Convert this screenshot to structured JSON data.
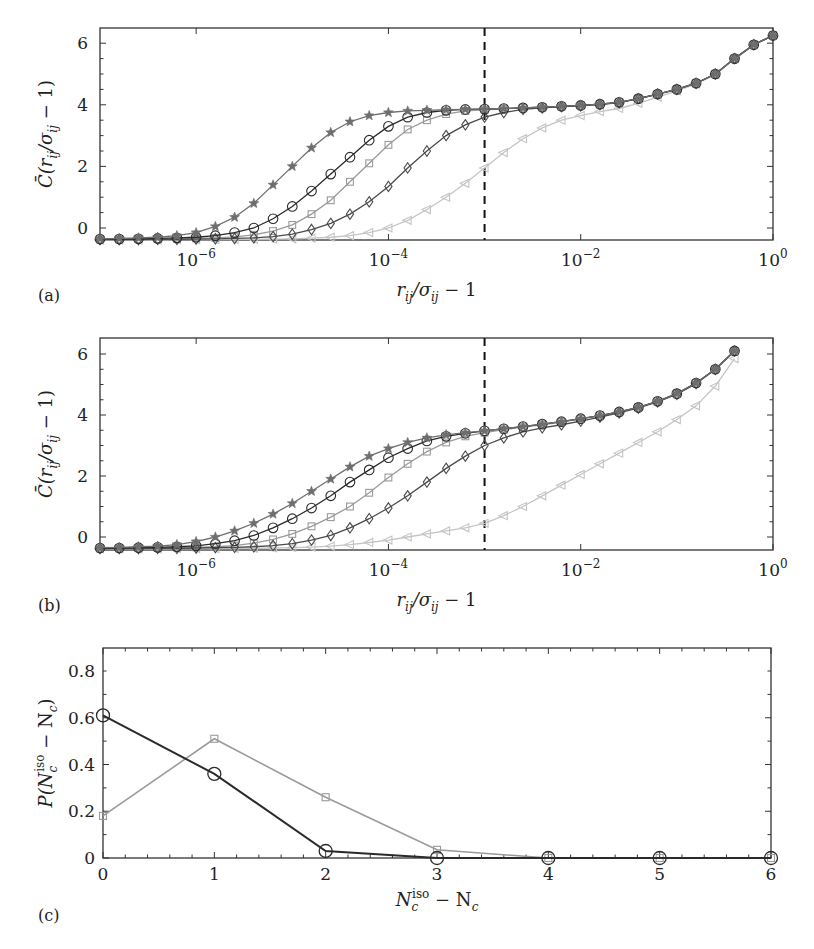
{
  "figure": {
    "panels": [
      {
        "id": "a",
        "label": "(a)",
        "xlabel": "r_ij/σ_ij − 1",
        "ylabel": "C̄(r_ij/σ_ij − 1)"
      },
      {
        "id": "b",
        "label": "(b)",
        "xlabel": "r_ij/σ_ij − 1",
        "ylabel": "C̄(r_ij/σ_ij − 1)"
      },
      {
        "id": "c",
        "label": "(c)",
        "xlabel": "N_c^iso − N_c",
        "ylabel": "P(N_c^iso − N_c)"
      }
    ]
  },
  "chart_data": [
    {
      "panel": "a",
      "type": "line",
      "title": "",
      "xlabel": "r_ij/σ_ij − 1",
      "ylabel": "C̄(r_ij/σ_ij − 1)",
      "xscale": "log",
      "xlim": [
        1e-07,
        1
      ],
      "ylim": [
        -0.4,
        6.4
      ],
      "xticks": [
        "10^-6",
        "10^-4",
        "10^-2",
        "10^0"
      ],
      "yticks": [
        "0",
        "2",
        "4",
        "6"
      ],
      "vline": {
        "x": 0.001,
        "style": "dashed",
        "color": "#111111"
      },
      "log10_x": [
        -7,
        -6.8,
        -6.6,
        -6.4,
        -6.2,
        -6,
        -5.8,
        -5.6,
        -5.4,
        -5.2,
        -5,
        -4.8,
        -4.6,
        -4.4,
        -4.2,
        -4,
        -3.8,
        -3.6,
        -3.4,
        -3.2,
        -3,
        -2.8,
        -2.6,
        -2.4,
        -2.2,
        -2,
        -1.8,
        -1.6,
        -1.4,
        -1.2,
        -1,
        -0.8,
        -0.6,
        -0.4,
        -0.2,
        0
      ],
      "series": [
        {
          "name": "star",
          "marker": "star",
          "color": "#6e6e6e",
          "values": [
            -0.35,
            -0.34,
            -0.32,
            -0.3,
            -0.25,
            -0.15,
            0.05,
            0.35,
            0.8,
            1.4,
            2.0,
            2.6,
            3.1,
            3.45,
            3.65,
            3.75,
            3.8,
            3.82,
            3.84,
            3.85,
            3.86,
            3.88,
            3.9,
            3.92,
            3.95,
            3.98,
            4.02,
            4.08,
            4.2,
            4.35,
            4.5,
            4.7,
            5.0,
            5.5,
            5.95,
            6.25
          ]
        },
        {
          "name": "circle",
          "marker": "circle",
          "color": "#2a2a2a",
          "values": [
            -0.36,
            -0.36,
            -0.35,
            -0.34,
            -0.32,
            -0.3,
            -0.25,
            -0.15,
            0.0,
            0.3,
            0.7,
            1.2,
            1.75,
            2.3,
            2.85,
            3.3,
            3.6,
            3.75,
            3.82,
            3.85,
            3.86,
            3.88,
            3.9,
            3.92,
            3.95,
            3.98,
            4.02,
            4.08,
            4.2,
            4.35,
            4.5,
            4.7,
            5.0,
            5.5,
            5.95,
            6.25
          ]
        },
        {
          "name": "square",
          "marker": "square",
          "color": "#9a9a9a",
          "values": [
            -0.37,
            -0.37,
            -0.36,
            -0.36,
            -0.35,
            -0.34,
            -0.32,
            -0.29,
            -0.22,
            -0.1,
            0.1,
            0.45,
            0.9,
            1.5,
            2.1,
            2.7,
            3.2,
            3.5,
            3.7,
            3.8,
            3.84,
            3.87,
            3.9,
            3.92,
            3.95,
            3.98,
            4.02,
            4.08,
            4.2,
            4.35,
            4.5,
            4.7,
            5.0,
            5.5,
            5.95,
            6.25
          ]
        },
        {
          "name": "diamond",
          "marker": "diamond",
          "color": "#4a4a4a",
          "values": [
            -0.38,
            -0.38,
            -0.38,
            -0.37,
            -0.37,
            -0.36,
            -0.35,
            -0.34,
            -0.32,
            -0.28,
            -0.2,
            -0.05,
            0.15,
            0.45,
            0.85,
            1.35,
            1.95,
            2.5,
            3.0,
            3.35,
            3.6,
            3.75,
            3.85,
            3.9,
            3.94,
            3.97,
            4.01,
            4.07,
            4.2,
            4.35,
            4.5,
            4.7,
            5.0,
            5.5,
            5.95,
            6.25
          ]
        },
        {
          "name": "triangle",
          "marker": "triangle",
          "color": "#c4c4c4",
          "values": [
            -0.39,
            -0.39,
            -0.39,
            -0.39,
            -0.38,
            -0.38,
            -0.38,
            -0.37,
            -0.37,
            -0.36,
            -0.35,
            -0.33,
            -0.3,
            -0.25,
            -0.15,
            0.0,
            0.25,
            0.6,
            1.0,
            1.45,
            1.95,
            2.45,
            2.9,
            3.25,
            3.5,
            3.65,
            3.78,
            3.88,
            4.05,
            4.25,
            4.45,
            4.68,
            4.98,
            5.5,
            5.95,
            6.25
          ]
        }
      ]
    },
    {
      "panel": "b",
      "type": "line",
      "title": "",
      "xlabel": "r_ij/σ_ij − 1",
      "ylabel": "C̄(r_ij/σ_ij − 1)",
      "xscale": "log",
      "xlim": [
        1e-07,
        1
      ],
      "ylim": [
        -0.4,
        6.4
      ],
      "xticks": [
        "10^-6",
        "10^-4",
        "10^-2",
        "10^0"
      ],
      "yticks": [
        "0",
        "2",
        "4",
        "6"
      ],
      "vline": {
        "x": 0.001,
        "style": "dashed",
        "color": "#111111"
      },
      "log10_x": [
        -7,
        -6.8,
        -6.6,
        -6.4,
        -6.2,
        -6,
        -5.8,
        -5.6,
        -5.4,
        -5.2,
        -5,
        -4.8,
        -4.6,
        -4.4,
        -4.2,
        -4,
        -3.8,
        -3.6,
        -3.4,
        -3.2,
        -3,
        -2.8,
        -2.6,
        -2.4,
        -2.2,
        -2,
        -1.8,
        -1.6,
        -1.4,
        -1.2,
        -1,
        -0.8,
        -0.6,
        -0.4
      ],
      "series": [
        {
          "name": "star",
          "marker": "star",
          "color": "#6e6e6e",
          "values": [
            -0.35,
            -0.34,
            -0.32,
            -0.3,
            -0.25,
            -0.15,
            0.0,
            0.2,
            0.45,
            0.75,
            1.1,
            1.5,
            1.9,
            2.3,
            2.65,
            2.9,
            3.1,
            3.25,
            3.35,
            3.42,
            3.48,
            3.55,
            3.62,
            3.7,
            3.78,
            3.88,
            3.98,
            4.1,
            4.25,
            4.45,
            4.7,
            5.05,
            5.5,
            6.1
          ]
        },
        {
          "name": "circle",
          "marker": "circle",
          "color": "#2a2a2a",
          "values": [
            -0.36,
            -0.36,
            -0.35,
            -0.34,
            -0.32,
            -0.29,
            -0.22,
            -0.12,
            0.05,
            0.3,
            0.6,
            0.95,
            1.35,
            1.8,
            2.2,
            2.6,
            2.9,
            3.15,
            3.3,
            3.4,
            3.48,
            3.55,
            3.62,
            3.7,
            3.78,
            3.88,
            3.98,
            4.1,
            4.25,
            4.45,
            4.7,
            5.05,
            5.5,
            6.1
          ]
        },
        {
          "name": "square",
          "marker": "square",
          "color": "#9a9a9a",
          "values": [
            -0.37,
            -0.37,
            -0.36,
            -0.36,
            -0.35,
            -0.34,
            -0.32,
            -0.28,
            -0.2,
            -0.08,
            0.1,
            0.35,
            0.65,
            1.0,
            1.45,
            1.95,
            2.4,
            2.8,
            3.1,
            3.3,
            3.42,
            3.52,
            3.6,
            3.68,
            3.77,
            3.87,
            3.98,
            4.1,
            4.25,
            4.45,
            4.7,
            5.05,
            5.5,
            6.1
          ]
        },
        {
          "name": "diamond",
          "marker": "diamond",
          "color": "#4a4a4a",
          "values": [
            -0.38,
            -0.38,
            -0.38,
            -0.37,
            -0.37,
            -0.36,
            -0.35,
            -0.34,
            -0.32,
            -0.28,
            -0.22,
            -0.1,
            0.05,
            0.3,
            0.6,
            0.95,
            1.35,
            1.8,
            2.25,
            2.65,
            3.0,
            3.25,
            3.45,
            3.58,
            3.68,
            3.8,
            3.93,
            4.07,
            4.23,
            4.43,
            4.68,
            5.03,
            5.5,
            6.1
          ]
        },
        {
          "name": "triangle",
          "marker": "triangle",
          "color": "#c4c4c4",
          "values": [
            -0.39,
            -0.39,
            -0.39,
            -0.39,
            -0.38,
            -0.38,
            -0.38,
            -0.37,
            -0.37,
            -0.36,
            -0.35,
            -0.33,
            -0.3,
            -0.25,
            -0.18,
            -0.1,
            0.0,
            0.1,
            0.2,
            0.3,
            0.45,
            0.7,
            1.0,
            1.35,
            1.7,
            2.05,
            2.4,
            2.75,
            3.1,
            3.45,
            3.85,
            4.3,
            4.95,
            5.85
          ]
        }
      ]
    },
    {
      "panel": "c",
      "type": "line",
      "title": "",
      "xlabel": "N_c^iso − N_c",
      "ylabel": "P(N_c^iso − N_c)",
      "xlim": [
        0,
        6
      ],
      "ylim": [
        0,
        0.9
      ],
      "xticks": [
        "0",
        "1",
        "2",
        "3",
        "4",
        "5",
        "6"
      ],
      "yticks": [
        "0",
        "0.2",
        "0.4",
        "0.6",
        "0.8"
      ],
      "x": [
        0,
        1,
        2,
        3,
        4,
        5,
        6
      ],
      "series": [
        {
          "name": "circle",
          "marker": "circle",
          "color": "#2a2a2a",
          "values": [
            0.61,
            0.36,
            0.03,
            0.0,
            0.0,
            0.0,
            0.0
          ]
        },
        {
          "name": "square",
          "marker": "square",
          "color": "#9a9a9a",
          "values": [
            0.18,
            0.51,
            0.26,
            0.035,
            0.0,
            0.0,
            0.0
          ]
        }
      ]
    }
  ]
}
